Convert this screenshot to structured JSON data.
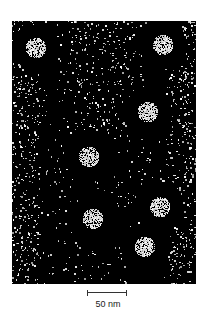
{
  "figure": {
    "type": "electron micrograph",
    "particles": [
      {
        "x": 24,
        "y": 27,
        "r": 10
      },
      {
        "x": 151,
        "y": 24,
        "r": 10
      },
      {
        "x": 136,
        "y": 91,
        "r": 10
      },
      {
        "x": 77,
        "y": 136,
        "r": 10
      },
      {
        "x": 148,
        "y": 186,
        "r": 10
      },
      {
        "x": 81,
        "y": 198,
        "r": 10
      },
      {
        "x": 133,
        "y": 226,
        "r": 10
      }
    ],
    "scale_bar": {
      "label": "50 nm"
    }
  }
}
